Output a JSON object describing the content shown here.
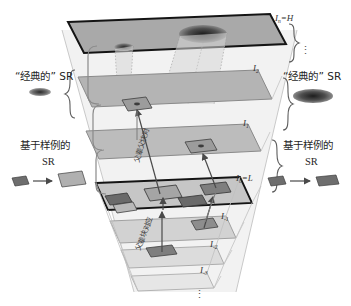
{
  "figure": {
    "type": "multi-scale-image-pyramid-diagram",
    "background": "#ffffff"
  },
  "plane_labels": {
    "top": "I",
    "top_sub": "n",
    "top_eq": "=H",
    "i2": "I",
    "i2_sub": "2",
    "i1": "I",
    "i1_sub": "1",
    "i0": "I",
    "i0_sub": "0",
    "i0_eq": "=L",
    "im1": "I",
    "im1_sub": "-1",
    "im2": "I",
    "im2_sub": "-2",
    "im3": "I",
    "im3_sub": "-3",
    "vdots_upper": "⋮",
    "vdots_lower": "⋮"
  },
  "left_panel": {
    "classical_sr": "“经典的” SR",
    "example_sr_line1": "基于样例的",
    "example_sr_line2": "SR"
  },
  "right_panel": {
    "classical_sr": "“经典的” SR",
    "example_sr_line1": "基于样例的",
    "example_sr_line2": "SR"
  },
  "diagonal_labels": {
    "upper": "父辈父块对",
    "lower": "父辈块对应"
  },
  "colors": {
    "plane_fill_dark": "#a9a9a9",
    "plane_fill_mid": "#b8b8b8",
    "plane_fill_light": "#cfcfcf",
    "plane_fill_faint": "#e2e2e2",
    "plane_stroke": "#7a7a7a",
    "plane_stroke_bold": "#1a1a1a",
    "patch_fill": "#8a8a8a",
    "patch_fill_dark": "#5a5a5a",
    "cone_fill": "#d9d9d9",
    "arrow_stroke": "#4a4a4a",
    "ellipse_dark": "#3a3a3a",
    "text": "#2b2b2b"
  },
  "icons": {
    "classical_ellipse": "blurred-ellipse-icon",
    "patch_parallelogram": "patch-parallelogram-icon",
    "mapping_arrow": "right-arrow-icon",
    "brace": "curly-brace-icon"
  }
}
